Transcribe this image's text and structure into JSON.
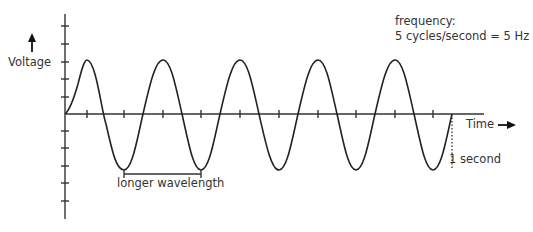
{
  "diagram": {
    "y_axis_label": "Voltage",
    "x_axis_label": "Time",
    "annotation_frequency_title": "frequency:",
    "annotation_frequency_value": "5 cycles/second = 5 Hz",
    "annotation_wavelength": "longer wavelength",
    "annotation_duration": "1 second",
    "wave": {
      "cycles": 5,
      "duration_s": 1,
      "frequency_hz": 5,
      "stroke_color": "#222222"
    },
    "icons": {
      "up_arrow": "arrow-up-icon",
      "right_arrow": "arrow-right-icon"
    }
  }
}
